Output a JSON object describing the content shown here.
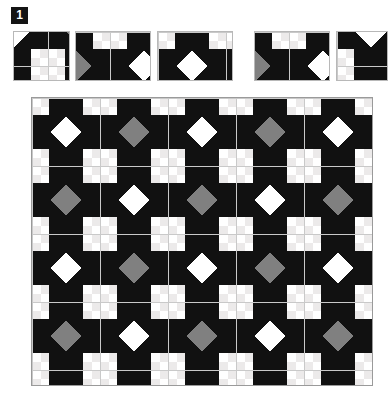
{
  "badge": {
    "label": "1"
  },
  "colors": {
    "dark": "#111111",
    "light": "#ffffff",
    "accent_gray": "#808080",
    "pale_gray": "#eceaea",
    "seam": "#c9c9c9",
    "border": "#9a9a9a",
    "sample_border": "#b8b8b8",
    "badge_bg": "#141414",
    "badge_fg": "#ffffff",
    "page_bg": "#ffffff"
  },
  "pattern": {
    "name": "sawtooth-star-quilt",
    "block_size_px": 68,
    "block_units": 4,
    "columns": 5,
    "rows": 4.25,
    "variants": [
      "star-gray-center",
      "star-white-center"
    ],
    "variant_rule": "checkerboard-alternating",
    "description": "Repeating 8-point sawtooth star quilt blocks alternating between a gray center diamond and a white center diamond, with pale gray accent squares in the corner four-patches."
  },
  "samples": {
    "count": 5,
    "tiles": [
      {
        "name": "sample-tile-1",
        "left": 13,
        "width": 57,
        "offset_x": 34,
        "offset_y": 34
      },
      {
        "name": "sample-tile-2",
        "left": 75,
        "width": 76,
        "offset_x": 102,
        "offset_y": 0
      },
      {
        "name": "sample-tile-3",
        "left": 157,
        "width": 76,
        "offset_x": 0,
        "offset_y": 0
      },
      {
        "name": "sample-tile-4",
        "left": 254,
        "width": 76,
        "offset_x": 102,
        "offset_y": 0
      },
      {
        "name": "sample-tile-5",
        "left": 336,
        "width": 52,
        "offset_x": 0,
        "offset_y": 34
      }
    ]
  },
  "quilt": {
    "left": 31,
    "top": 97,
    "width": 342,
    "height": 289,
    "visible_columns": 5,
    "visible_rows": 4.25
  }
}
